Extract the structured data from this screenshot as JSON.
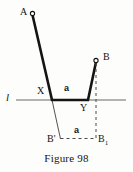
{
  "figure": {
    "caption": "Figure 98",
    "line_label": "l",
    "points": {
      "A": "A",
      "B": "B",
      "X": "X",
      "Y": "Y",
      "B_prime": "B'",
      "B_one_base": "B",
      "B_one_sub": "1"
    },
    "segment_labels": {
      "top_a": "a",
      "bottom_a": "a"
    },
    "colors": {
      "stroke_solid": "#141414",
      "stroke_thin": "#3a3a3a",
      "stroke_axis": "#555555",
      "stroke_dashed": "#4a4a4a",
      "background": "#fdfdfb"
    },
    "geometry": {
      "line_l": {
        "x1": 16,
        "y1": 100,
        "x2": 126,
        "y2": 100
      },
      "path_AXYB": [
        {
          "name": "A",
          "x": 32,
          "y": 14
        },
        {
          "name": "X",
          "x": 52,
          "y": 100
        },
        {
          "name": "Y",
          "x": 88,
          "y": 100
        },
        {
          "name": "B",
          "x": 96,
          "y": 61
        }
      ],
      "thin_X_to_Bprime": {
        "x1": 52,
        "y1": 100,
        "x2": 60,
        "y2": 138
      },
      "dashed_B_to_B1": {
        "x1": 96,
        "y1": 62,
        "x2": 96,
        "y2": 138
      },
      "dashed_Bprime_to_B1": {
        "x1": 60,
        "y1": 138,
        "x2": 96,
        "y2": 138
      },
      "marker_A": {
        "cx": 32,
        "cy": 14,
        "r": 2
      },
      "marker_B": {
        "cx": 96,
        "cy": 61,
        "r": 2
      }
    }
  }
}
